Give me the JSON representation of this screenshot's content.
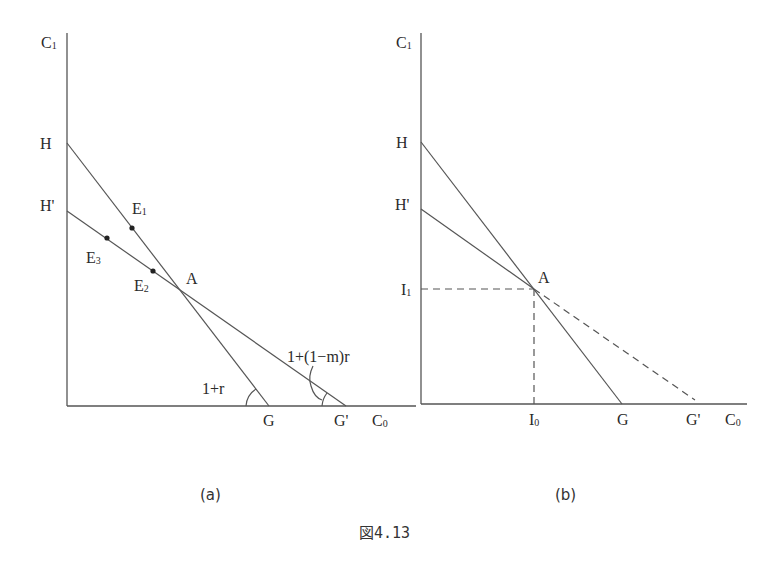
{
  "figure": {
    "caption": "図4.13",
    "panels": [
      {
        "id": "a",
        "caption": "(a)",
        "y_axis_label": {
          "main": "C",
          "sub": "1"
        },
        "x_axis_label": {
          "main": "C",
          "sub": "0"
        },
        "labels": {
          "H": "H",
          "H_prime": "H'",
          "G": "G",
          "G_prime": "G'",
          "A": "A",
          "E1": {
            "main": "E",
            "sub": "1"
          },
          "E2": {
            "main": "E",
            "sub": "2"
          },
          "E3": {
            "main": "E",
            "sub": "3"
          },
          "angle_G": "1+r",
          "angle_G_prime": "1+(1−m)r"
        },
        "lines": [
          {
            "name": "HG",
            "from": "H",
            "to": "G",
            "style": "solid"
          },
          {
            "name": "H'G'",
            "from": "H'",
            "to": "G'",
            "style": "solid"
          }
        ],
        "points": [
          "E1",
          "E2",
          "E3",
          "A"
        ]
      },
      {
        "id": "b",
        "caption": "(b)",
        "y_axis_label": {
          "main": "C",
          "sub": "1"
        },
        "x_axis_label": {
          "main": "C",
          "sub": "0"
        },
        "labels": {
          "H": "H",
          "H_prime": "H'",
          "G": "G",
          "G_prime": "G'",
          "A": "A",
          "I1": {
            "main": "I",
            "sub": "1"
          },
          "I0": {
            "main": "I",
            "sub": "0"
          }
        },
        "lines": [
          {
            "name": "HG",
            "from": "H",
            "to": "G",
            "style": "solid"
          },
          {
            "name": "H'A",
            "from": "H'",
            "to": "A",
            "style": "solid"
          },
          {
            "name": "AG'",
            "from": "A",
            "to": "G'",
            "style": "dashed"
          },
          {
            "name": "I1-A",
            "from": "I1",
            "to": "A",
            "style": "dashed"
          },
          {
            "name": "I0-A",
            "from": "I0",
            "to": "A",
            "style": "dashed"
          }
        ]
      }
    ]
  }
}
